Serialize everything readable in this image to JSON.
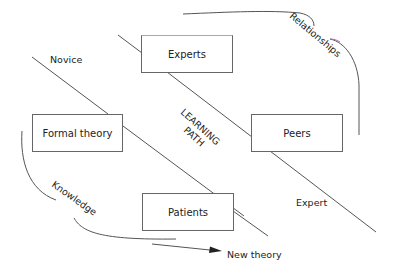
{
  "diagram": {
    "boxes": {
      "experts": "Experts",
      "formal_theory": "Formal theory",
      "peers": "Peers",
      "patients": "Patients"
    },
    "labels": {
      "novice": "Novice",
      "expert": "Expert",
      "learning": "LEARNING",
      "path": "PATH",
      "relationships": "Relationships",
      "knowledge": "Knowledge",
      "new_theory": "New theory"
    },
    "colors": {
      "line": "#555555",
      "box_border": "#666666",
      "experts_top_accent": "#66dd55"
    }
  }
}
